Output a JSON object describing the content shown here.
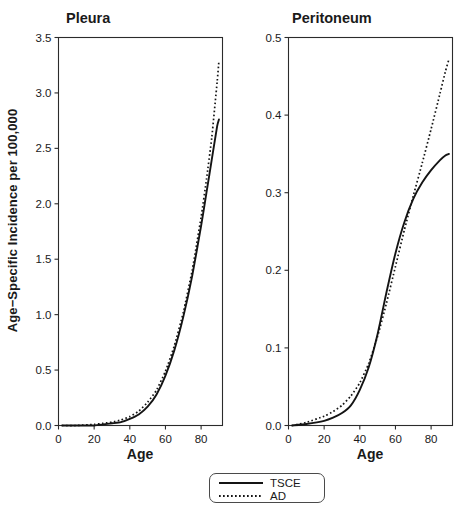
{
  "figure": {
    "ylabel": "Age−Specific Incidence per 100,000",
    "background_color": "#ffffff",
    "line_color": "#141414"
  },
  "legend": {
    "entries": [
      {
        "label": "TSCE",
        "style": "solid"
      },
      {
        "label": "AD",
        "style": "dotted"
      }
    ]
  },
  "chart_data": [
    {
      "type": "line",
      "title": "Pleura",
      "xlabel": "Age",
      "ylabel": "Age−Specific Incidence per 100,000",
      "xlim": [
        0,
        92
      ],
      "ylim": [
        0.0,
        3.5
      ],
      "xticks": [
        0,
        20,
        40,
        60,
        80
      ],
      "yticks": [
        0.0,
        0.5,
        1.0,
        1.5,
        2.0,
        2.5,
        3.0,
        3.5
      ],
      "ytick_labels": [
        "0.0",
        "0.5",
        "1.0",
        "1.5",
        "2.0",
        "2.5",
        "3.0",
        "3.5"
      ],
      "xtick_labels": [
        "0",
        "20",
        "40",
        "60",
        "80"
      ],
      "grid": false,
      "legend_position": "below-figure",
      "series": [
        {
          "name": "TSCE",
          "style": "solid",
          "x": [
            2,
            10,
            20,
            25,
            30,
            35,
            40,
            45,
            50,
            55,
            60,
            65,
            70,
            75,
            80,
            83,
            86,
            89,
            90
          ],
          "values": [
            0.0,
            0.0,
            0.0,
            0.01,
            0.02,
            0.03,
            0.06,
            0.1,
            0.17,
            0.28,
            0.45,
            0.68,
            0.98,
            1.35,
            1.8,
            2.1,
            2.4,
            2.7,
            2.76
          ]
        },
        {
          "name": "AD",
          "style": "dotted",
          "x": [
            2,
            10,
            20,
            25,
            30,
            35,
            40,
            45,
            50,
            55,
            60,
            65,
            70,
            75,
            80,
            83,
            86,
            89,
            90
          ],
          "values": [
            0.0,
            0.0,
            0.01,
            0.02,
            0.03,
            0.05,
            0.08,
            0.13,
            0.21,
            0.32,
            0.49,
            0.72,
            1.02,
            1.4,
            1.88,
            2.22,
            2.6,
            3.1,
            3.29
          ]
        }
      ]
    },
    {
      "type": "line",
      "title": "Peritoneum",
      "xlabel": "Age",
      "ylabel": "Age−Specific Incidence per 100,000",
      "xlim": [
        0,
        92
      ],
      "ylim": [
        0.0,
        0.5
      ],
      "xticks": [
        0,
        20,
        40,
        60,
        80
      ],
      "yticks": [
        0.0,
        0.1,
        0.2,
        0.3,
        0.4,
        0.5
      ],
      "ytick_labels": [
        "0.0",
        "0.1",
        "0.2",
        "0.3",
        "0.4",
        "0.5"
      ],
      "xtick_labels": [
        "0",
        "20",
        "40",
        "60",
        "80"
      ],
      "grid": false,
      "legend_position": "below-figure",
      "series": [
        {
          "name": "TSCE",
          "style": "solid",
          "x": [
            2,
            10,
            20,
            25,
            30,
            35,
            40,
            45,
            50,
            55,
            60,
            65,
            70,
            75,
            80,
            85,
            88,
            90
          ],
          "values": [
            0.0,
            0.002,
            0.006,
            0.01,
            0.016,
            0.026,
            0.046,
            0.075,
            0.118,
            0.172,
            0.222,
            0.262,
            0.292,
            0.313,
            0.329,
            0.342,
            0.348,
            0.35
          ]
        },
        {
          "name": "AD",
          "style": "dotted",
          "x": [
            2,
            10,
            20,
            25,
            30,
            35,
            40,
            45,
            50,
            55,
            60,
            65,
            70,
            75,
            80,
            85,
            88,
            90
          ],
          "values": [
            0.0,
            0.004,
            0.012,
            0.018,
            0.026,
            0.038,
            0.055,
            0.08,
            0.115,
            0.158,
            0.205,
            0.252,
            0.296,
            0.338,
            0.382,
            0.428,
            0.456,
            0.472
          ]
        }
      ]
    }
  ]
}
